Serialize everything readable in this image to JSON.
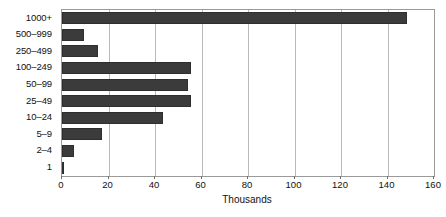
{
  "chart_data": {
    "type": "bar",
    "orientation": "horizontal",
    "title": "",
    "xlabel": "Thousands",
    "ylabel": "",
    "categories": [
      "1000+",
      "500–999",
      "250–499",
      "100–249",
      "50–99",
      "25–49",
      "10–24",
      "5–9",
      "2–4",
      "1"
    ],
    "values": [
      148.5,
      9.5,
      15.5,
      55.5,
      54,
      55.5,
      43.5,
      17,
      5,
      0.3
    ],
    "xlim": [
      0,
      160
    ],
    "xticks": [
      0,
      20,
      40,
      60,
      80,
      100,
      120,
      140,
      160
    ],
    "xticklabels": [
      "0",
      "20",
      "40",
      "60",
      "80",
      "100",
      "120",
      "140",
      "160"
    ],
    "grid": "vertical",
    "legend": "none",
    "bar_color": "#3b3b3b",
    "bar_edge_color": "#2e2e2e",
    "gridline_color": "#b9b9b9",
    "axis_color": "#9a9a9a"
  }
}
